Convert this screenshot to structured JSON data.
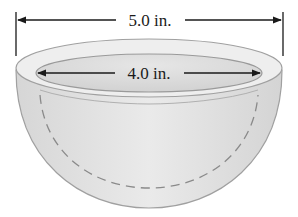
{
  "diagram": {
    "outer_dimension": {
      "label": "5.0 in.",
      "measure": "outer diameter"
    },
    "inner_dimension": {
      "label": "4.0 in.",
      "measure": "inner diameter"
    },
    "hidden_line": "dashed inner bowl surface"
  },
  "colors": {
    "bowl_fill": "#e4e4e4",
    "rim_fill": "#ececec",
    "inner_fill": "#dcdcdc",
    "outline": "#9a9a9a",
    "arrows": "#1a1a1a"
  }
}
